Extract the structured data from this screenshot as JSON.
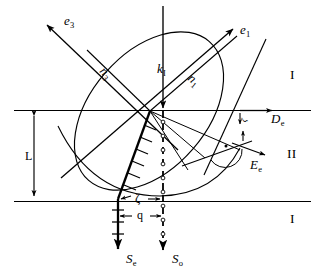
{
  "figure": {
    "background_color": "#ffffff",
    "stroke_color": "#000000",
    "width": 323,
    "height": 277
  },
  "regions": {
    "top": "I",
    "middle": "II",
    "bottom": "I"
  },
  "vectors": {
    "e3": "e",
    "e3_sub": "3",
    "e1": "e",
    "e1_sub": "1",
    "kI": "k",
    "kI_sub": "I",
    "n3": "n",
    "n3_sub": "3",
    "n1": "n",
    "n1_sub": "1",
    "De": "D",
    "De_sub": "e",
    "Ee": "E",
    "Ee_sub": "e",
    "Se": "S",
    "Se_sub": "e",
    "So": "S",
    "So_sub": "o"
  },
  "dimensions": {
    "thickness": "L",
    "displacement": "q",
    "walkoff_angle": "ζ",
    "small_angle": "ζ"
  }
}
